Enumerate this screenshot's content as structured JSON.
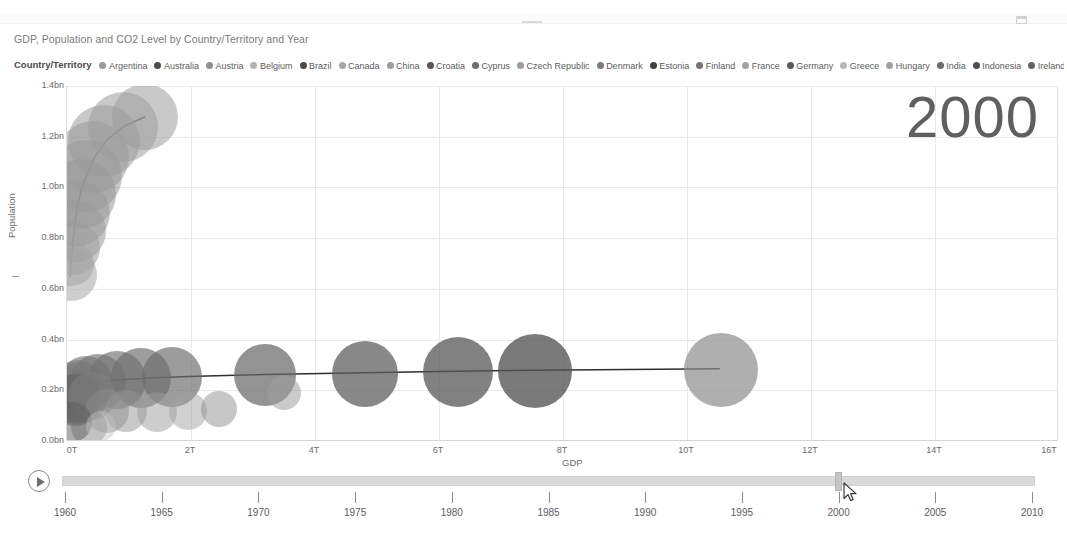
{
  "window": {
    "restore_icon": "restore-icon"
  },
  "report": {
    "title": "GDP, Population and CO2 Level by Country/Territory and Year"
  },
  "legend": {
    "title": "Country/Territory",
    "more_arrow": "▶",
    "items": [
      {
        "label": "Argentina",
        "color": "#9a9a9a"
      },
      {
        "label": "Australia",
        "color": "#4d4d4d"
      },
      {
        "label": "Austria",
        "color": "#8f8f8f"
      },
      {
        "label": "Belgium",
        "color": "#b2b2b2"
      },
      {
        "label": "Brazil",
        "color": "#4a4a4a"
      },
      {
        "label": "Canada",
        "color": "#a8a8a8"
      },
      {
        "label": "China",
        "color": "#9e9e9e"
      },
      {
        "label": "Croatia",
        "color": "#565656"
      },
      {
        "label": "Cyprus",
        "color": "#6e6e6e"
      },
      {
        "label": "Czech Republic",
        "color": "#9c9c9c"
      },
      {
        "label": "Denmark",
        "color": "#7b7b7b"
      },
      {
        "label": "Estonia",
        "color": "#3f3f3f"
      },
      {
        "label": "Finland",
        "color": "#757575"
      },
      {
        "label": "France",
        "color": "#a3a3a3"
      },
      {
        "label": "Germany",
        "color": "#5a5a5a"
      },
      {
        "label": "Greece",
        "color": "#b8b8b8"
      },
      {
        "label": "Hungary",
        "color": "#a0a0a0"
      },
      {
        "label": "India",
        "color": "#6b6b6b"
      },
      {
        "label": "Indonesia",
        "color": "#4f4f4f"
      },
      {
        "label": "Ireland",
        "color": "#636363"
      },
      {
        "label": "Italy",
        "color": "#545454"
      },
      {
        "label": "Japan",
        "color": "#484848"
      }
    ]
  },
  "year_display": "2000",
  "chart_data": {
    "type": "scatter",
    "title": "GDP, Population and CO2 Level by Country/Territory and Year",
    "xlabel": "GDP",
    "ylabel": "Population",
    "xlim": [
      0,
      16000000000000
    ],
    "ylim": [
      0,
      1400000000
    ],
    "xticks": [
      "0T",
      "2T",
      "4T",
      "6T",
      "8T",
      "10T",
      "12T",
      "14T",
      "16T"
    ],
    "yticks": [
      "0.0bn",
      "0.2bn",
      "0.4bn",
      "0.6bn",
      "0.8bn",
      "1.0bn",
      "1.2bn",
      "1.4bn"
    ],
    "grid": true,
    "legend_position": "top",
    "size_encoding": "CO2 Level",
    "animation_field": "Year",
    "current_frame": "2000",
    "points": [
      {
        "x": 0.06,
        "y": 0.655,
        "r": 26,
        "color": "#b0b0b0",
        "opacity": 0.62
      },
      {
        "x": 0.08,
        "y": 0.7,
        "r": 22,
        "color": "#a9a9a9",
        "opacity": 0.62
      },
      {
        "x": 0.1,
        "y": 0.76,
        "r": 27,
        "color": "#a5a5a5",
        "opacity": 0.6
      },
      {
        "x": 0.13,
        "y": 0.83,
        "r": 31,
        "color": "#a0a0a0",
        "opacity": 0.6
      },
      {
        "x": 0.16,
        "y": 0.9,
        "r": 33,
        "color": "#9d9d9d",
        "opacity": 0.58
      },
      {
        "x": 0.22,
        "y": 0.975,
        "r": 35,
        "color": "#9a9a9a",
        "opacity": 0.58
      },
      {
        "x": 0.3,
        "y": 1.045,
        "r": 36,
        "color": "#999999",
        "opacity": 0.56
      },
      {
        "x": 0.42,
        "y": 1.12,
        "r": 36,
        "color": "#9a9a9a",
        "opacity": 0.56
      },
      {
        "x": 0.6,
        "y": 1.185,
        "r": 36,
        "color": "#9b9b9b",
        "opacity": 0.55
      },
      {
        "x": 0.9,
        "y": 1.24,
        "r": 35,
        "color": "#9c9c9c",
        "opacity": 0.55
      },
      {
        "x": 1.25,
        "y": 1.278,
        "r": 33,
        "color": "#9d9d9d",
        "opacity": 0.55
      },
      {
        "x": 0.05,
        "y": 0.21,
        "r": 21,
        "color": "#8a8a8a",
        "opacity": 0.66
      },
      {
        "x": 0.1,
        "y": 0.215,
        "r": 23,
        "color": "#858585",
        "opacity": 0.66
      },
      {
        "x": 0.18,
        "y": 0.222,
        "r": 25,
        "color": "#7f7f7f",
        "opacity": 0.66
      },
      {
        "x": 0.3,
        "y": 0.228,
        "r": 27,
        "color": "#7a7a7a",
        "opacity": 0.66
      },
      {
        "x": 0.5,
        "y": 0.233,
        "r": 28,
        "color": "#767676",
        "opacity": 0.66
      },
      {
        "x": 0.8,
        "y": 0.24,
        "r": 29,
        "color": "#727272",
        "opacity": 0.66
      },
      {
        "x": 1.2,
        "y": 0.247,
        "r": 30,
        "color": "#6f6f6f",
        "opacity": 0.68
      },
      {
        "x": 1.7,
        "y": 0.253,
        "r": 30,
        "color": "#6d6d6d",
        "opacity": 0.68
      },
      {
        "x": 3.2,
        "y": 0.259,
        "r": 31,
        "color": "#6a6a6a",
        "opacity": 0.72
      },
      {
        "x": 4.8,
        "y": 0.266,
        "r": 33,
        "color": "#5f5f5f",
        "opacity": 0.74
      },
      {
        "x": 6.3,
        "y": 0.272,
        "r": 35,
        "color": "#5a5a5a",
        "opacity": 0.76
      },
      {
        "x": 7.55,
        "y": 0.275,
        "r": 37,
        "color": "#555555",
        "opacity": 0.78
      },
      {
        "x": 10.55,
        "y": 0.281,
        "r": 37,
        "color": "#8d8d8d",
        "opacity": 0.7
      },
      {
        "x": 0.06,
        "y": 0.165,
        "r": 24,
        "color": "#707070",
        "opacity": 0.55
      },
      {
        "x": 0.13,
        "y": 0.16,
        "r": 26,
        "color": "#5e5e5e",
        "opacity": 0.55
      },
      {
        "x": 0.24,
        "y": 0.17,
        "r": 25,
        "color": "#6a6a6a",
        "opacity": 0.55
      },
      {
        "x": 0.4,
        "y": 0.178,
        "r": 24,
        "color": "#808080",
        "opacity": 0.55
      },
      {
        "x": 0.65,
        "y": 0.12,
        "r": 22,
        "color": "#8c8c8c",
        "opacity": 0.5
      },
      {
        "x": 0.95,
        "y": 0.118,
        "r": 21,
        "color": "#949494",
        "opacity": 0.5
      },
      {
        "x": 1.45,
        "y": 0.115,
        "r": 20,
        "color": "#9b9b9b",
        "opacity": 0.5
      },
      {
        "x": 1.95,
        "y": 0.12,
        "r": 19,
        "color": "#a2a2a2",
        "opacity": 0.5
      },
      {
        "x": 2.45,
        "y": 0.125,
        "r": 18,
        "color": "#8f8f8f",
        "opacity": 0.5
      },
      {
        "x": 3.5,
        "y": 0.19,
        "r": 17,
        "color": "#9e9e9e",
        "opacity": 0.55
      },
      {
        "x": 0.35,
        "y": 0.055,
        "r": 18,
        "color": "#777777",
        "opacity": 0.45
      },
      {
        "x": 0.08,
        "y": 0.075,
        "r": 20,
        "color": "#5b5b5b",
        "opacity": 0.5
      },
      {
        "x": 0.55,
        "y": 0.06,
        "r": 15,
        "color": "#c3c3c3",
        "opacity": 0.45
      }
    ],
    "trails": [
      {
        "name": "china-trail",
        "path": [
          [
            0.05,
            0.645
          ],
          [
            0.07,
            0.7
          ],
          [
            0.09,
            0.77
          ],
          [
            0.12,
            0.84
          ],
          [
            0.16,
            0.91
          ],
          [
            0.22,
            0.98
          ],
          [
            0.32,
            1.05
          ],
          [
            0.45,
            1.12
          ],
          [
            0.64,
            1.185
          ],
          [
            0.92,
            1.24
          ],
          [
            1.26,
            1.278
          ]
        ]
      },
      {
        "name": "usa-trail",
        "path": [
          [
            0.18,
            0.212
          ],
          [
            0.35,
            0.224
          ],
          [
            0.6,
            0.232
          ],
          [
            0.95,
            0.239
          ],
          [
            1.4,
            0.246
          ],
          [
            2.1,
            0.252
          ],
          [
            3.2,
            0.259
          ],
          [
            4.8,
            0.266
          ],
          [
            6.3,
            0.272
          ],
          [
            7.55,
            0.276
          ],
          [
            10.55,
            0.282
          ]
        ]
      }
    ]
  },
  "timeline": {
    "play_label": "play-icon",
    "value": "2000",
    "min": "1960",
    "max": "2010",
    "ticks": [
      "1960",
      "1965",
      "1970",
      "1975",
      "1980",
      "1985",
      "1990",
      "1995",
      "2000",
      "2005",
      "2010"
    ]
  }
}
